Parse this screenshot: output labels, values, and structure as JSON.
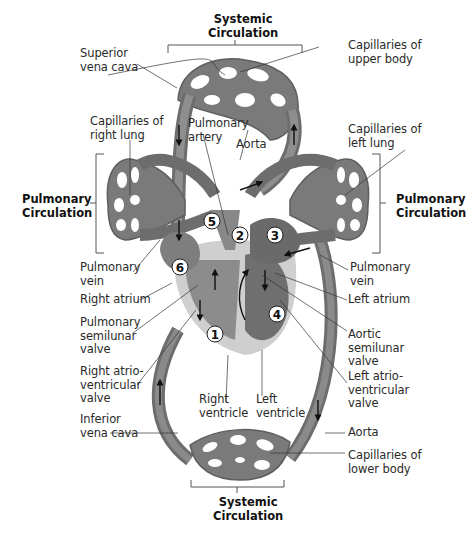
{
  "diagram": {
    "section_labels": {
      "systemic_top": "Systemic\nCirculation",
      "systemic_bottom": "Systemic\nCirculation",
      "pulmonary_left": "Pulmonary\nCirculation",
      "pulmonary_right": "Pulmonary\nCirculation"
    },
    "labels_left": [
      {
        "id": "superior-vena-cava",
        "text": "Superior\nvena cava"
      },
      {
        "id": "capillaries-right-lung",
        "text": "Capillaries of\nright lung"
      },
      {
        "id": "pulmonary-vein-left",
        "text": "Pulmonary\nvein"
      },
      {
        "id": "right-atrium",
        "text": "Right atrium"
      },
      {
        "id": "pulmonary-semilunar-valve",
        "text": "Pulmonary\nsemilunar\nvalve"
      },
      {
        "id": "right-av-valve",
        "text": "Right atrio-\nventricular\nvalve"
      },
      {
        "id": "inferior-vena-cava",
        "text": "Inferior\nvena cava"
      }
    ],
    "labels_center": [
      {
        "id": "pulmonary-artery",
        "text": "Pulmonary\nartery"
      },
      {
        "id": "aorta-top",
        "text": "Aorta"
      },
      {
        "id": "right-ventricle",
        "text": "Right\nventricle"
      },
      {
        "id": "left-ventricle",
        "text": "Left\nventricle"
      }
    ],
    "labels_right": [
      {
        "id": "capillaries-upper-body",
        "text": "Capillaries of\nupper body"
      },
      {
        "id": "capillaries-left-lung",
        "text": "Capillaries of\nleft lung"
      },
      {
        "id": "pulmonary-vein-right",
        "text": "Pulmonary\nvein"
      },
      {
        "id": "left-atrium",
        "text": "Left atrium"
      },
      {
        "id": "aortic-semilunar-valve",
        "text": "Aortic\nsemilunar\nvalve"
      },
      {
        "id": "left-av-valve",
        "text": "Left atrio-\nventricular\nvalve"
      },
      {
        "id": "aorta-bottom",
        "text": "Aorta"
      },
      {
        "id": "capillaries-lower-body",
        "text": "Capillaries of\nlower body"
      }
    ],
    "step_numbers": [
      "1",
      "2",
      "3",
      "4",
      "5",
      "6"
    ],
    "colors": {
      "vessel": "#7a7a7a",
      "vessel_dark": "#5e5e5e",
      "vessel_light": "#9a9a9a",
      "heart_outer": "#cfcfcf",
      "heart_inner": "#a8a8a8",
      "text": "#2a2a2a",
      "bracket": "#555555"
    }
  }
}
